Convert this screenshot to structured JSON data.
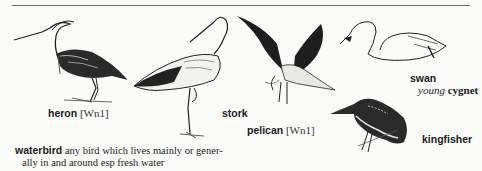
{
  "page": {
    "background": "#fbfbf9",
    "ink": "#1b1b1b"
  },
  "labels": {
    "heron": {
      "word": "heron",
      "code": "[Wn1]"
    },
    "stork": {
      "word": "stork"
    },
    "pelican": {
      "word": "pelican",
      "code": "[Wn1]"
    },
    "swan": {
      "word": "swan",
      "young_label": "young",
      "young_word": "cygnet"
    },
    "kingfisher": {
      "word": "kingfisher"
    }
  },
  "definition": {
    "headword": "waterbird",
    "line1": "any bird which lives mainly or gener-",
    "line2": "ally in and around esp fresh water"
  },
  "icons": [
    "heron-illustration",
    "stork-illustration",
    "pelican-illustration",
    "swan-illustration",
    "kingfisher-illustration"
  ]
}
